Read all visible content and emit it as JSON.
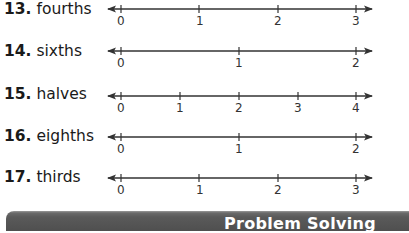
{
  "exercises": [
    {
      "number": "13.",
      "label": "fourths",
      "ticks": [
        "0",
        "1",
        "2",
        "3"
      ]
    },
    {
      "number": "14.",
      "label": "sixths",
      "ticks": [
        "0",
        "1",
        "2"
      ]
    },
    {
      "number": "15.",
      "label": "halves",
      "ticks": [
        "0",
        "1",
        "2",
        "3",
        "4"
      ]
    },
    {
      "number": "16.",
      "label": "eighths",
      "ticks": [
        "0",
        "1",
        "2"
      ]
    },
    {
      "number": "17.",
      "label": "thirds",
      "ticks": [
        "0",
        "1",
        "2",
        "3"
      ]
    }
  ],
  "banner": {
    "title": "Problem Solving"
  },
  "colors": {
    "line": "#333333",
    "text": "#1a1a1a",
    "banner": "#555555"
  }
}
